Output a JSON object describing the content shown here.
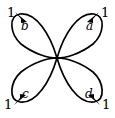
{
  "figure": {
    "kind": "directed-multigraph-bouquet",
    "background_color": "#ffffff",
    "stroke_color": "#000000",
    "vertex": {
      "name": "center-vertex",
      "x": 57,
      "y": 58
    },
    "loops": [
      {
        "id": "a",
        "label": "a",
        "weight": "1",
        "direction": "upper-right",
        "arrow_direction": "up-right",
        "label_x": 86,
        "label_y": 20,
        "weight_x": 101,
        "weight_y": 6
      },
      {
        "id": "b",
        "label": "b",
        "weight": "1",
        "direction": "upper-left",
        "arrow_direction": "up-left",
        "label_x": 21,
        "label_y": 20,
        "weight_x": 7,
        "weight_y": 6
      },
      {
        "id": "c",
        "label": "c",
        "weight": "1",
        "direction": "lower-left",
        "arrow_direction": "down-left",
        "label_x": 22,
        "label_y": 88,
        "weight_x": 4,
        "weight_y": 98
      },
      {
        "id": "d",
        "label": "d",
        "weight": "1",
        "direction": "lower-right",
        "arrow_direction": "down-right",
        "label_x": 85,
        "label_y": 88,
        "weight_x": 102,
        "weight_y": 98
      }
    ]
  }
}
